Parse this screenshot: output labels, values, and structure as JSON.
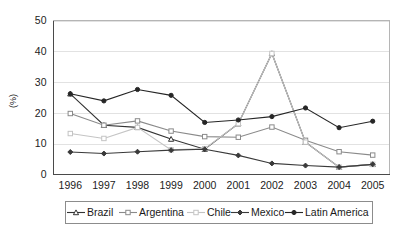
{
  "chart_data": {
    "type": "line",
    "title": "",
    "xlabel": "",
    "ylabel": "(%)",
    "categories": [
      "1996",
      "1997",
      "1998",
      "1999",
      "2000",
      "2001",
      "2002",
      "2003",
      "2004",
      "2005"
    ],
    "ylim": [
      0,
      50
    ],
    "yticks": [
      0,
      10,
      20,
      30,
      40,
      50
    ],
    "grid": true,
    "legend_position": "bottom",
    "series": [
      {
        "name": "Brazil",
        "marker": "triangle",
        "color": "#333333",
        "values": [
          26.2,
          16.0,
          15.3,
          11.5,
          8.2,
          16.5,
          39.3,
          10.5,
          2.4,
          3.3
        ]
      },
      {
        "name": "Argentina",
        "marker": "square",
        "color": "#8a8a8a",
        "values": [
          19.8,
          16.0,
          17.4,
          14.1,
          12.3,
          12.1,
          15.4,
          11.1,
          7.4,
          6.3
        ]
      },
      {
        "name": "Chile",
        "marker": "square",
        "color": "#c4c4c4",
        "values": [
          13.3,
          11.7,
          15.3,
          8.0,
          8.4,
          16.5,
          39.3,
          10.5,
          2.4,
          3.3
        ]
      },
      {
        "name": "Mexico",
        "marker": "diamond",
        "color": "#3a3a3a",
        "values": [
          7.3,
          6.8,
          7.4,
          7.9,
          8.2,
          6.2,
          3.6,
          2.9,
          2.4,
          3.3
        ]
      },
      {
        "name": "Latin America",
        "marker": "circle",
        "color": "#262626",
        "values": [
          26.2,
          23.9,
          27.6,
          25.7,
          16.9,
          17.7,
          18.8,
          21.6,
          15.2,
          17.3
        ]
      }
    ]
  },
  "legend": {
    "items": [
      {
        "label": "Brazil"
      },
      {
        "label": "Argentina"
      },
      {
        "label": "Chile"
      },
      {
        "label": "Mexico"
      },
      {
        "label": "Latin America"
      }
    ]
  },
  "axes": {
    "y_label": "(%)",
    "y_ticks": [
      "0",
      "10",
      "20",
      "30",
      "40",
      "50"
    ],
    "x_ticks": [
      "1996",
      "1997",
      "1998",
      "1999",
      "2000",
      "2001",
      "2002",
      "2003",
      "2004",
      "2005"
    ]
  }
}
